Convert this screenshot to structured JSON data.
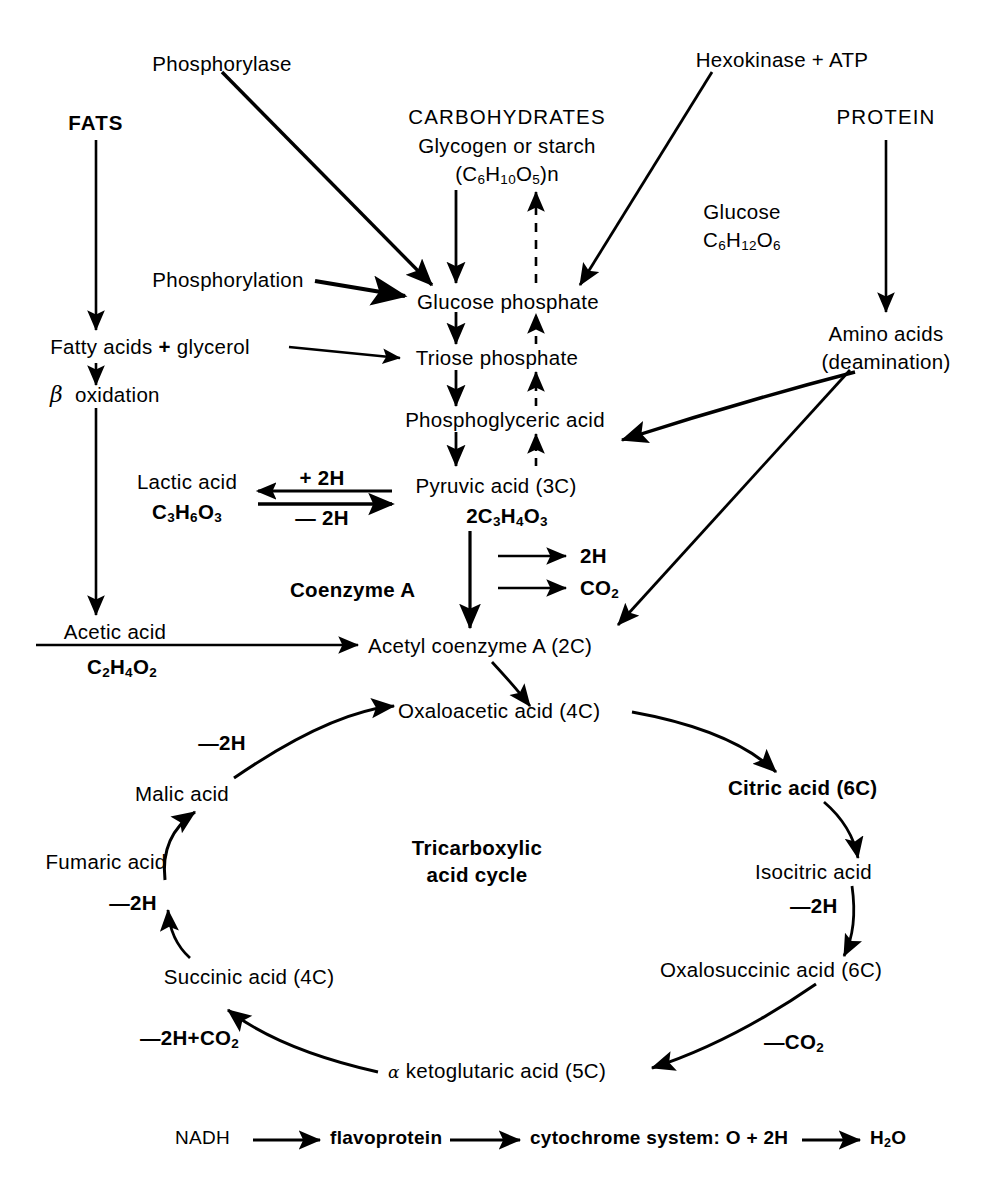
{
  "diagram": {
    "colors": {
      "ink": "#000000",
      "background": "#ffffff"
    },
    "nodes": {
      "phosphorylase": "Phosphorylase",
      "hexokinase_atp": "Hexokinase + ATP",
      "fats": "FATS",
      "carbohydrates": "CARBOHYDRATES",
      "glycogen_or_starch": "Glycogen or starch",
      "glycogen_formula_pre": "(C",
      "glycogen_formula": "(C6H10O5)n",
      "protein": "PROTEIN",
      "glucose": "Glucose",
      "glucose_formula": "C6H12O6",
      "phosphorylation": "Phosphorylation",
      "glucose_phosphate": "Glucose phosphate",
      "fatty_acids_glycerol": "Fatty acids + glycerol",
      "amino_acids": "Amino acids",
      "deamination": "(deamination)",
      "triose_phosphate": "Triose phosphate",
      "beta_oxidation": "oxidation",
      "beta_symbol": "β",
      "phosphoglyceric_acid": "Phosphoglyceric acid",
      "lactic_acid": "Lactic acid",
      "lactic_acid_formula": "C3H6O3",
      "plus_2h": "+ 2H",
      "minus_2h": "— 2H",
      "pyruvic_acid": "Pyruvic acid (3C)",
      "pyruvic_formula": "2C3H4O3",
      "two_h": "2H",
      "co2": "CO2",
      "coenzyme_a": "Coenzyme A",
      "acetic_acid": "Acetic acid",
      "acetic_acid_formula": "C2H4O2",
      "acetyl_coenzyme_a": "Acetyl coenzyme A (2C)",
      "oxaloacetic_acid": "Oxaloacetic acid (4C)",
      "citric_acid": "Citric acid (6C)",
      "malic_acid": "Malic acid",
      "isocitric_acid": "Isocitric acid",
      "fumaric_acid": "Fumaric acid",
      "oxalosuccinic_acid": "Oxalosuccinic acid   (6C)",
      "succinic_acid": "Succinic acid (4C)",
      "alpha_ketoglutaric_acid": "ketoglutaric acid (5C)",
      "alpha_symbol": "α",
      "cycle_line1": "Tricarboxylic",
      "cycle_line2": "acid cycle",
      "minus_2h_malate": "—2H",
      "minus_2h_fumarate": "—2H",
      "minus_2h_co2": "—2H+CO2",
      "minus_2h_isocitrate": "—2H",
      "minus_co2": "—CO2",
      "nadh": "NADH",
      "flavoprotein": "flavoprotein",
      "cytochrome": "cytochrome system: O + 2H",
      "water": "H2O"
    },
    "chain_labels": {
      "nadh": "NADH",
      "flavoprotein": "flavoprotein",
      "cytochrome_system": "cytochrome system: O + 2H",
      "h2o": "H2O"
    }
  }
}
